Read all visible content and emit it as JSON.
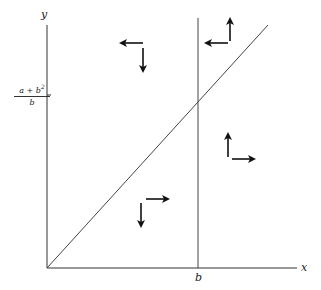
{
  "diagram": {
    "axes": {
      "x_label": "x",
      "y_label": "y"
    },
    "tick_labels": {
      "x_tick": "b",
      "y_tick": {
        "numerator": "a + b",
        "exponent": "2",
        "denominator": "b"
      }
    },
    "lines": [
      "diagonal line from origin",
      "vertical line at x = b"
    ],
    "arrow_pairs": [
      {
        "region": "top-left",
        "directions": [
          "left",
          "down"
        ]
      },
      {
        "region": "top-right",
        "directions": [
          "left",
          "up"
        ]
      },
      {
        "region": "bottom-right",
        "directions": [
          "up",
          "right"
        ]
      },
      {
        "region": "bottom-left",
        "directions": [
          "right",
          "down"
        ]
      }
    ],
    "colors": {
      "ink": "#222222",
      "background": "#ffffff"
    }
  }
}
